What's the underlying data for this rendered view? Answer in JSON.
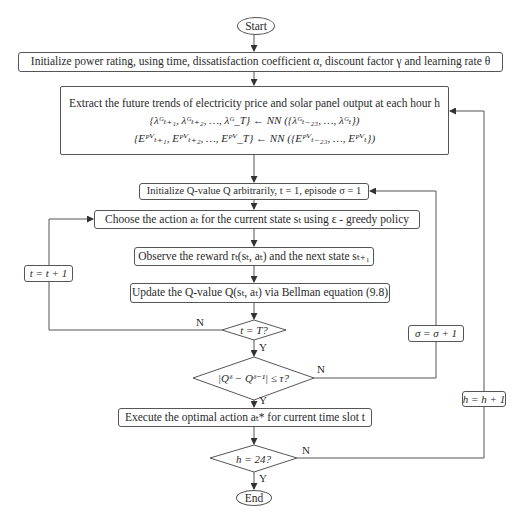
{
  "nodes": {
    "start": "Start",
    "init_params": "Initialize power rating, using time, dissatisfaction coefficient α, discount factor γ and learning rate θ",
    "extract": {
      "line1": "Extract the future trends of electricity price and solar panel output at each hour h",
      "line2": "{λᴳₜ₊₁, λᴳₜ₊₂, …, λᴳ_T} ← NN ({λᴳₜ₋₂₃, …, λᴳₜ})",
      "line3": "{Eᴾⱽₜ₊₁, Eᴾⱽₜ₊₂, …, Eᴾⱽ_T} ← NN ({Eᴾⱽₜ₋₂₃, …, Eᴾⱽₜ})"
    },
    "init_q": "Initialize Q-value Q arbitrarily, t = 1, episode σ = 1",
    "choose_action": "Choose the action aₜ for the current state sₜ using ε - greedy policy",
    "observe": "Observe the reward rₜ(sₜ, aₜ) and the next state sₜ₊₁",
    "update_q": "Update the Q-value Q(sₜ, aₜ) via Bellman equation (9.8)",
    "decision_t": "t = T?",
    "decision_conv": "|Qᵟ − Qᵟ⁻¹| ≤ τ?",
    "execute": "Execute the optimal action aₜ* for current time slot t",
    "decision_h": "h = 24?",
    "end": "End"
  },
  "loops": {
    "t_increment": "t = t + 1",
    "sigma_increment": "σ = σ + 1",
    "h_increment": "h = h + 1"
  },
  "branch_labels": {
    "yes": "Y",
    "no": "N"
  }
}
